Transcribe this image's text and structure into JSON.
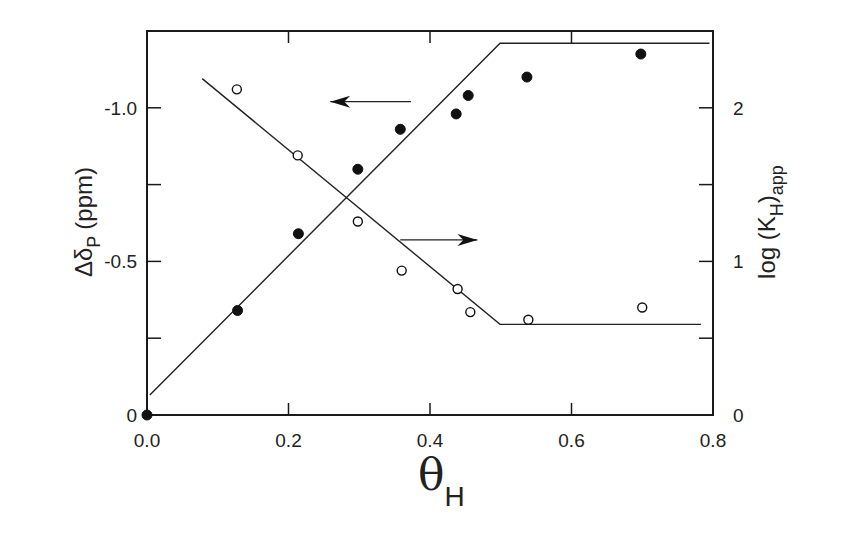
{
  "chart_data": {
    "type": "scatter",
    "title": "",
    "xlabel": "θ",
    "xlabel_sub": "H",
    "ylabel_left": "Δδ",
    "ylabel_left_sub": "P",
    "ylabel_left_unit": "(ppm)",
    "ylabel_right": "log (K",
    "ylabel_right_sub1": "H",
    "ylabel_right_close": ")",
    "ylabel_right_sub2": "app",
    "xlim": [
      0.0,
      0.8
    ],
    "ylim_left": [
      0,
      -1.25
    ],
    "ylim_right": [
      0,
      2.5
    ],
    "x_ticks": [
      0.0,
      0.2,
      0.4,
      0.6,
      0.8
    ],
    "x_tick_labels": [
      "0.0",
      "0.2",
      "0.4",
      "0.6",
      "0.8"
    ],
    "y_left_ticks": [
      0,
      -0.25,
      -0.5,
      -0.75,
      -1.0
    ],
    "y_left_tick_labels": [
      "0",
      "",
      "-0.5",
      "",
      "-1.0"
    ],
    "y_right_ticks": [
      0,
      0.5,
      1,
      1.5,
      2
    ],
    "y_right_tick_labels": [
      "0",
      "",
      "1",
      "",
      "2"
    ],
    "grid": false,
    "legend": null,
    "series": [
      {
        "name": "Δδ_P (filled circles, left axis)",
        "marker": "filled-circle",
        "axis": "left",
        "x": [
          0.0,
          0.128,
          0.214,
          0.298,
          0.358,
          0.437,
          0.454,
          0.537,
          0.698
        ],
        "y": [
          0.0,
          -0.34,
          -0.59,
          -0.8,
          -0.93,
          -0.98,
          -1.04,
          -1.1,
          -1.175
        ]
      },
      {
        "name": "log(K_H)app (open circles, right axis)",
        "marker": "open-circle",
        "axis": "right",
        "x": [
          0.127,
          0.213,
          0.298,
          0.36,
          0.439,
          0.457,
          0.539,
          0.7
        ],
        "y": [
          2.12,
          1.69,
          1.26,
          0.94,
          0.82,
          0.67,
          0.62,
          0.7
        ]
      },
      {
        "name": "Δδ_P fit line",
        "type": "line",
        "axis": "left",
        "x": [
          0.004,
          0.499,
          0.795
        ],
        "y": [
          -0.065,
          -1.21,
          -1.21
        ]
      },
      {
        "name": "log(K_H)app fit line",
        "type": "line",
        "axis": "right",
        "x": [
          0.078,
          0.499,
          0.783
        ],
        "y": [
          2.19,
          0.59,
          0.59
        ]
      }
    ],
    "annotations": [
      {
        "type": "arrow",
        "direction": "left",
        "label": "points to left axis",
        "from": [
          0.373,
          -1.02
        ],
        "to": [
          0.259,
          -1.02
        ]
      },
      {
        "type": "arrow",
        "direction": "right",
        "label": "points to right axis",
        "from": [
          0.358,
          1.14
        ],
        "to": [
          0.467,
          1.14
        ]
      }
    ]
  }
}
